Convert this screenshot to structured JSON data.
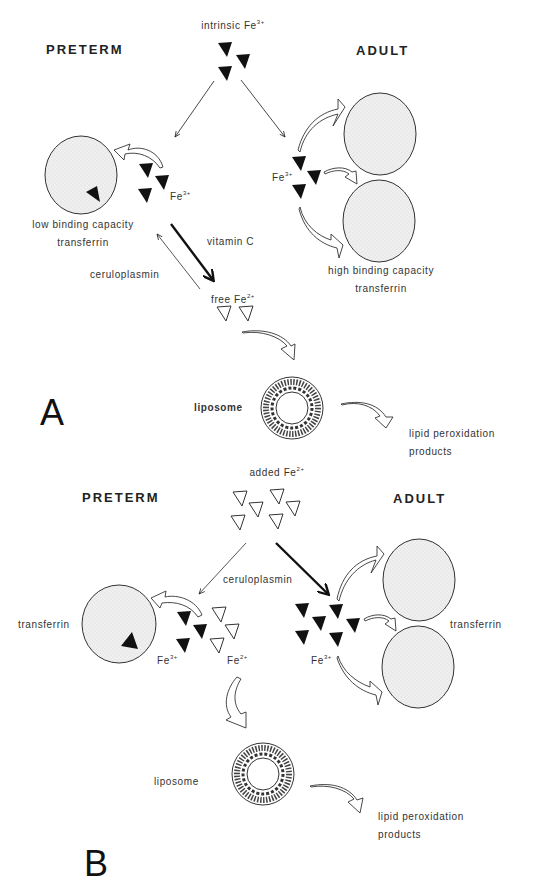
{
  "figure": {
    "panel_a": {
      "label": "A",
      "source_label": "intrinsic Fe",
      "source_charge": "3+",
      "left_heading": "PRETERM",
      "right_heading": "ADULT",
      "preterm_iron_label": "Fe",
      "preterm_iron_charge": "3+",
      "preterm_transferrin_line1": "low binding capacity",
      "preterm_transferrin_line2": "transferrin",
      "adult_iron_label": "Fe",
      "adult_iron_charge": "3+",
      "adult_transferrin_line1": "high binding capacity",
      "adult_transferrin_line2": "transferrin",
      "reduction_agent": "vitamin C",
      "oxidation_agent": "ceruloplasmin",
      "free_iron_label": "free Fe",
      "free_iron_charge": "2+",
      "liposome_label": "liposome",
      "products_line1": "lipid peroxidation",
      "products_line2": "products"
    },
    "panel_b": {
      "label": "B",
      "source_label": "added Fe",
      "source_charge": "2+",
      "left_heading": "PRETERM",
      "right_heading": "ADULT",
      "oxidation_agent": "ceruloplasmin",
      "preterm_transferrin_label": "transferrin",
      "preterm_fe3_label": "Fe",
      "preterm_fe3_charge": "3+",
      "preterm_fe2_label": "Fe",
      "preterm_fe2_charge": "2+",
      "adult_iron_label": "Fe",
      "adult_iron_charge": "3+",
      "adult_transferrin_label": "transferrin",
      "liposome_label": "liposome",
      "products_line1": "lipid peroxidation",
      "products_line2": "products"
    },
    "legend_symbols": {
      "filled_triangle": "Fe3+ (ferric iron)",
      "open_triangle": "Fe2+ (ferrous iron)",
      "stippled_circle": "transferrin",
      "bilayer_ring": "liposome"
    },
    "colors": {
      "ink": "#1a1a1a",
      "transferrin_fill": "#ececec",
      "background": "#ffffff"
    }
  }
}
